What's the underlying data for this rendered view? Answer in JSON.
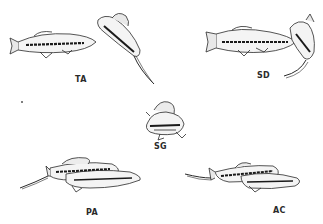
{
  "figure": {
    "panels": [
      {
        "id": "TA",
        "label": "TA",
        "position": "top-left",
        "description": "two fish, one horizontal, one angled downward"
      },
      {
        "id": "SD",
        "label": "SD",
        "position": "top-right",
        "description": "horizontal fish beside curled fish"
      },
      {
        "id": "SG",
        "label": "SG",
        "position": "center",
        "description": "fish viewed head-on with raised dorsal fin"
      },
      {
        "id": "PA",
        "label": "PA",
        "position": "bottom-left",
        "description": "two fish side by side, one with sword tail"
      },
      {
        "id": "AC",
        "label": "AC",
        "position": "bottom-right",
        "description": "two fish overlapping, one with sword tail"
      }
    ],
    "colors": {
      "ink": "#2a2a2a",
      "stripe": "#1a1a1a",
      "background": "#ffffff"
    }
  }
}
